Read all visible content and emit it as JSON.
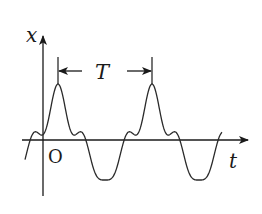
{
  "diagram": {
    "colors": {
      "stroke": "#2a2a2a",
      "background": "#ffffff"
    },
    "axes": {
      "y_label": "x",
      "x_label": "t",
      "origin_label": "O"
    },
    "period_marker": {
      "label": "T"
    },
    "waveform": {
      "description": "periodic wave: fundamental sine plus higher harmonic ripple",
      "periods_shown": 2.1
    }
  }
}
